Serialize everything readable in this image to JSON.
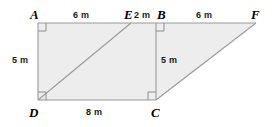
{
  "figure": {
    "fill_color": "#ededed",
    "stroke_color": "#9a9a9a",
    "label_color": "#000000",
    "background_color": "#ffffff",
    "vertices": [
      {
        "id": "A",
        "label": "A",
        "x": 38,
        "y": 23,
        "label_x": 30,
        "label_y": 8
      },
      {
        "id": "E",
        "label": "E",
        "x": 131,
        "y": 23,
        "label_x": 124,
        "label_y": 8
      },
      {
        "id": "B",
        "label": "B",
        "x": 156,
        "y": 23,
        "label_x": 158,
        "label_y": 8
      },
      {
        "id": "F",
        "label": "F",
        "x": 256,
        "y": 23,
        "label_x": 252,
        "label_y": 8
      },
      {
        "id": "D",
        "label": "D",
        "x": 38,
        "y": 100,
        "label_x": 30,
        "label_y": 107
      },
      {
        "id": "C",
        "label": "C",
        "x": 156,
        "y": 100,
        "label_x": 152,
        "label_y": 107
      }
    ],
    "measurements": [
      {
        "id": "AE",
        "text": "6 m",
        "x": 72,
        "y": 11,
        "segment": "A-E"
      },
      {
        "id": "EB",
        "text": "2 m",
        "x": 135,
        "y": 11,
        "segment": "E-B"
      },
      {
        "id": "BF",
        "text": "6 m",
        "x": 195,
        "y": 11,
        "segment": "B-F"
      },
      {
        "id": "AD",
        "text": "5 m",
        "x": 11,
        "y": 56,
        "segment": "A-D"
      },
      {
        "id": "BC",
        "text": "5 m",
        "x": 161,
        "y": 56,
        "segment": "B-C"
      },
      {
        "id": "DC",
        "text": "8 m",
        "x": 85,
        "y": 108,
        "segment": "D-C"
      }
    ],
    "right_angles": [
      {
        "id": "angle-A",
        "at": "A",
        "x": 38,
        "y": 23,
        "dx": 1,
        "dy": 1
      },
      {
        "id": "angle-B",
        "at": "B",
        "x": 156,
        "y": 23,
        "dx": 1,
        "dy": 1
      },
      {
        "id": "angle-D",
        "at": "D",
        "x": 38,
        "y": 100,
        "dx": 1,
        "dy": -1
      },
      {
        "id": "angle-C",
        "at": "C",
        "x": 156,
        "y": 100,
        "dx": 1,
        "dy": -1
      }
    ],
    "segments": [
      {
        "id": "A-F",
        "from": "A",
        "to": "F",
        "kind": "outline-top"
      },
      {
        "id": "A-D",
        "from": "A",
        "to": "D",
        "kind": "outline-left"
      },
      {
        "id": "D-C",
        "from": "D",
        "to": "C",
        "kind": "outline-bottom"
      },
      {
        "id": "B-C",
        "from": "B",
        "to": "C",
        "kind": "interior-vertical"
      },
      {
        "id": "D-E",
        "from": "D",
        "to": "E",
        "kind": "interior-diagonal"
      },
      {
        "id": "C-F",
        "from": "C",
        "to": "F",
        "kind": "outline-hypotenuse"
      }
    ]
  }
}
